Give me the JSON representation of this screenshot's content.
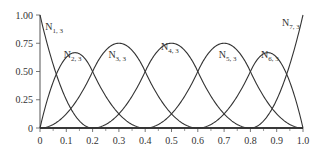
{
  "chart_data": {
    "type": "line",
    "title": "",
    "xlabel": "",
    "ylabel": "",
    "xlim": [
      0,
      1.0
    ],
    "ylim": [
      0,
      1.0
    ],
    "grid": false,
    "x_ticks": [
      "0",
      "0.1",
      "0.2",
      "0.3",
      "0.4",
      "0.5",
      "0.6",
      "0.7",
      "0.8",
      "0.9",
      "1.0"
    ],
    "y_ticks": [
      "0",
      "0.25",
      "0.50",
      "0.75",
      "1.00"
    ],
    "knots": [
      0,
      0,
      0,
      0.2,
      0.4,
      0.6,
      0.8,
      1.0,
      1.0,
      1.0
    ],
    "order": 3,
    "series": [
      {
        "name": "N1,3",
        "base": "N",
        "sub": "1, 3",
        "label_x": 0.02,
        "label_y": 0.87
      },
      {
        "name": "N2,3",
        "base": "N",
        "sub": "2, 3",
        "label_x": 0.09,
        "label_y": 0.62
      },
      {
        "name": "N3,3",
        "base": "N",
        "sub": "3, 3",
        "label_x": 0.26,
        "label_y": 0.62
      },
      {
        "name": "N4,3",
        "base": "N",
        "sub": "4, 3",
        "label_x": 0.46,
        "label_y": 0.69
      },
      {
        "name": "N5,3",
        "base": "N",
        "sub": "5, 3",
        "label_x": 0.68,
        "label_y": 0.62
      },
      {
        "name": "N6,3",
        "base": "N",
        "sub": "6, 3",
        "label_x": 0.84,
        "label_y": 0.62
      },
      {
        "name": "N7,3",
        "base": "N",
        "sub": "7, 3",
        "label_x": 0.92,
        "label_y": 0.9
      }
    ],
    "colors": {
      "curve": "#333333",
      "axis": "#555555"
    }
  }
}
